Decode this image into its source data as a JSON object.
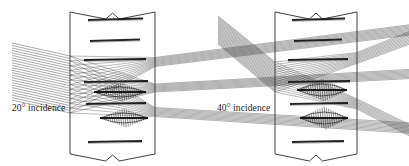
{
  "figure": {
    "background_color": "#ffffff",
    "ink_color": "#2b2b2b",
    "beam_color": "#4a4a4a",
    "dark_color": "#111111",
    "width": 409,
    "height": 166
  },
  "panels": [
    {
      "id": "left-panel",
      "caption": "20° incidence",
      "incidence_angle_deg": 20,
      "caption_x": 12,
      "caption_y": 104,
      "slab": {
        "left_x": 70,
        "right_x": 155,
        "top_y": 12,
        "bottom_y": 154,
        "break_top": true,
        "break_bottom": true
      },
      "layers": [
        {
          "x1": 88,
          "x2": 143,
          "y1": 20,
          "y2": 18.5
        },
        {
          "x1": 90,
          "x2": 140,
          "y1": 41,
          "y2": 39.5
        },
        {
          "x1": 84,
          "x2": 146,
          "y1": 60,
          "y2": 59
        },
        {
          "x1": 84,
          "x2": 148,
          "y1": 82,
          "y2": 81
        },
        {
          "x1": 86,
          "x2": 146,
          "y1": 104,
          "y2": 103
        },
        {
          "x1": 88,
          "x2": 142,
          "y1": 142,
          "y2": 141
        }
      ]
    },
    {
      "id": "right-panel",
      "caption": "40° incidence",
      "incidence_angle_deg": 40,
      "caption_x": 217,
      "caption_y": 104,
      "slab": {
        "left_x": 275,
        "right_x": 357,
        "top_y": 12,
        "bottom_y": 154,
        "break_top": true,
        "break_bottom": true
      },
      "layers": [
        {
          "x1": 292,
          "x2": 345,
          "y1": 20,
          "y2": 18.5
        },
        {
          "x1": 294,
          "x2": 342,
          "y1": 41,
          "y2": 39.5
        },
        {
          "x1": 288,
          "x2": 348,
          "y1": 60,
          "y2": 59
        },
        {
          "x1": 288,
          "x2": 350,
          "y1": 82,
          "y2": 81
        },
        {
          "x1": 290,
          "x2": 348,
          "y1": 104,
          "y2": 103
        },
        {
          "x1": 292,
          "x2": 344,
          "y1": 142,
          "y2": 141
        }
      ]
    }
  ],
  "beams": {
    "left": {
      "incoming": {
        "from_x": 12,
        "from_y_top": 43,
        "from_y_bottom": 100,
        "to_x": 70,
        "to_y_top": 56,
        "to_y_bottom": 113,
        "ray_count": 24
      },
      "exits": [
        {
          "name": "upper-exit",
          "x1": 155,
          "y1": 62,
          "x2": 409,
          "y2": 30,
          "spread": 9,
          "ray_count": 10
        },
        {
          "name": "mid-exit",
          "x1": 155,
          "y1": 88,
          "x2": 409,
          "y2": 74,
          "spread": 8,
          "ray_count": 9
        },
        {
          "name": "lower-exit",
          "x1": 155,
          "y1": 112,
          "x2": 409,
          "y2": 128,
          "spread": 9,
          "ray_count": 9
        }
      ],
      "focus_spots": [
        {
          "cx": 120,
          "cy": 92,
          "rx": 26,
          "ry": 5
        },
        {
          "cx": 124,
          "cy": 118,
          "rx": 24,
          "ry": 5
        }
      ]
    },
    "right": {
      "incoming": {
        "from_x": 218,
        "from_y_top": 16,
        "from_y_bottom": 44,
        "to_x": 275,
        "to_y_top": 62,
        "to_y_bottom": 92,
        "ray_count": 24
      },
      "exits": [
        {
          "name": "upper-exit",
          "x1": 357,
          "y1": 58,
          "x2": 409,
          "y2": 38,
          "spread": 11,
          "ray_count": 10
        },
        {
          "name": "lower-exit",
          "x1": 357,
          "y1": 104,
          "x2": 409,
          "y2": 130,
          "spread": 10,
          "ray_count": 9
        }
      ],
      "focus_spots": [
        {
          "cx": 322,
          "cy": 90,
          "rx": 25,
          "ry": 6
        },
        {
          "cx": 324,
          "cy": 118,
          "rx": 24,
          "ry": 6
        }
      ]
    }
  }
}
